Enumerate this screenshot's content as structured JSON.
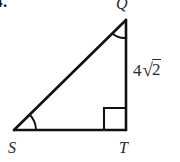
{
  "figure": {
    "question_number": "4.",
    "type": "right-triangle-diagram",
    "vertices": {
      "q": {
        "label": "Q",
        "x": 126,
        "y": 20
      },
      "s": {
        "label": "S",
        "x": 14,
        "y": 130
      },
      "t": {
        "label": "T",
        "x": 126,
        "y": 130
      }
    },
    "side_labels": {
      "qt": {
        "full_text": "4√2",
        "coefficient": "4",
        "radical_sign": "√",
        "radicand": "2"
      }
    },
    "markers": {
      "right_angle_vertex": "T",
      "angle_arc_vertices": [
        "Q",
        "S"
      ]
    },
    "colors": {
      "background": "#ffffff",
      "stroke": "#111111",
      "label_text": "#2b2b2b"
    }
  }
}
